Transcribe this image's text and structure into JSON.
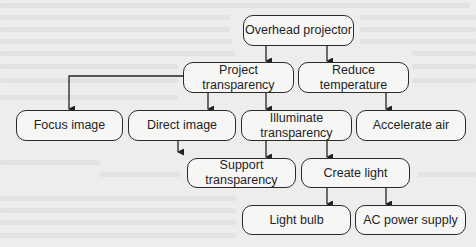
{
  "diagram": {
    "type": "function-decomposition-tree",
    "colors": {
      "background": "#ededec",
      "box_fill": "#f6f6f5",
      "stroke": "#2a2a2a",
      "text": "#1f1f1f"
    },
    "nodes": [
      {
        "id": "overhead_projector",
        "label": "Overhead projector",
        "x": 243,
        "y": 15,
        "w": 111,
        "h": 31
      },
      {
        "id": "project_transparency",
        "label": "Project transparency",
        "x": 183,
        "y": 62,
        "w": 111,
        "h": 31
      },
      {
        "id": "reduce_temperature",
        "label": "Reduce temperature",
        "x": 298,
        "y": 62,
        "w": 111,
        "h": 31
      },
      {
        "id": "focus_image",
        "label": "Focus image",
        "x": 16,
        "y": 110,
        "w": 107,
        "h": 31
      },
      {
        "id": "direct_image",
        "label": "Direct image",
        "x": 128,
        "y": 110,
        "w": 108,
        "h": 31
      },
      {
        "id": "illuminate_transparency",
        "label": "Illuminate transparency",
        "x": 241,
        "y": 110,
        "w": 111,
        "h": 31
      },
      {
        "id": "accelerate_air",
        "label": "Accelerate air",
        "x": 356,
        "y": 110,
        "w": 110,
        "h": 31
      },
      {
        "id": "support_transparency",
        "label": "Support transparency",
        "x": 187,
        "y": 158,
        "w": 109,
        "h": 30
      },
      {
        "id": "create_light",
        "label": "Create light",
        "x": 301,
        "y": 158,
        "w": 109,
        "h": 30
      },
      {
        "id": "light_bulb",
        "label": "Light bulb",
        "x": 242,
        "y": 205,
        "w": 109,
        "h": 30
      },
      {
        "id": "ac_power_supply",
        "label": "AC power supply",
        "x": 355,
        "y": 205,
        "w": 111,
        "h": 30
      }
    ],
    "edges": [
      {
        "from": "overhead_projector",
        "to": "project_transparency"
      },
      {
        "from": "overhead_projector",
        "to": "reduce_temperature"
      },
      {
        "from": "project_transparency",
        "to": "focus_image"
      },
      {
        "from": "project_transparency",
        "to": "direct_image"
      },
      {
        "from": "project_transparency",
        "to": "illuminate_transparency"
      },
      {
        "from": "reduce_temperature",
        "to": "accelerate_air"
      },
      {
        "from": "illuminate_transparency",
        "to": "support_transparency"
      },
      {
        "from": "illuminate_transparency",
        "to": "create_light"
      },
      {
        "from": "create_light",
        "to": "light_bulb"
      },
      {
        "from": "create_light",
        "to": "ac_power_supply"
      }
    ]
  }
}
